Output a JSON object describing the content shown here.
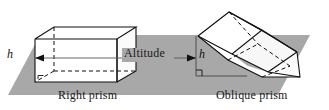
{
  "figure": {
    "background_color": "#ffffff",
    "plane": {
      "name": "base-plane",
      "fill_color": "#a8a8a8",
      "points": "8,95 40,35 310,35 278,95"
    },
    "labels": {
      "right_prism": "Right prism",
      "oblique_prism": "Oblique prism",
      "altitude": "Altitude",
      "height_left": "h",
      "height_right": "h"
    },
    "colors": {
      "stroke": "#111111",
      "face_light": "#ffffff",
      "face_shade": "#f2f2f2",
      "plane_gray": "#a8a8a8",
      "leader_line": "#555555",
      "text": "#1a1a1a"
    },
    "right_prism": {
      "front_face": "35,39 35,82 76,82 76,39",
      "top_back_edge": "54,27 136,27",
      "right_face": "76,39 76,82 117,71 117,28",
      "hidden_edges": [
        "54,27 54,71",
        "54,71 117,71",
        "54,71 35,82"
      ],
      "visible_edges": [
        "35,39 54,27",
        "76,39 95,27",
        "76,39 117,28",
        "35,39 76,39",
        "35,39 35,82",
        "35,82 76,82",
        "76,82 76,39",
        "76,82 117,71",
        "117,71 117,28",
        "117,28 76,39",
        "54,27 117,28",
        "35,39 54,27"
      ],
      "right_angle_marker": "38,79 38,76 44,76",
      "altitude_segment": "35,58 35,58"
    },
    "oblique_prism": {
      "right_angle_marker": "196,72 196,66 203,66",
      "vertical_drop": "196,36 196,76",
      "base_line": "196,76 246,76"
    },
    "altitude_arrow": {
      "start_x": 38,
      "end_x": 196,
      "y": 58,
      "label_x": 143,
      "label_y": 49
    }
  }
}
